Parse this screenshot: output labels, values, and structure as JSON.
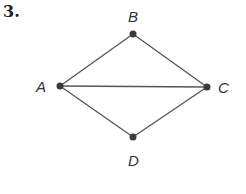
{
  "problem": {
    "number": "3."
  },
  "graph": {
    "vertices": [
      {
        "id": "A",
        "label": "A",
        "x": 60,
        "y": 86
      },
      {
        "id": "B",
        "label": "B",
        "x": 133,
        "y": 34
      },
      {
        "id": "C",
        "label": "C",
        "x": 207,
        "y": 87
      },
      {
        "id": "D",
        "label": "D",
        "x": 133,
        "y": 137
      }
    ],
    "edges": [
      [
        "A",
        "B"
      ],
      [
        "B",
        "C"
      ],
      [
        "A",
        "C"
      ],
      [
        "A",
        "D"
      ],
      [
        "D",
        "C"
      ]
    ],
    "colors": {
      "edge": "#555555",
      "vertex": "#3a3a3a",
      "label": "#333333"
    }
  }
}
